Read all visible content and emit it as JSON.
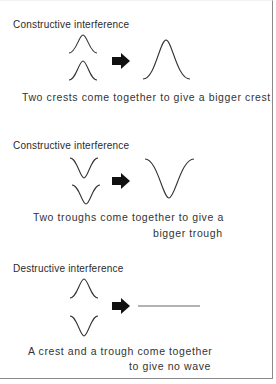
{
  "sections": [
    {
      "title": "Constructive interference",
      "caption_lines": [
        "Two crests come together to give a bigger crest"
      ],
      "inputs": [
        "crest",
        "crest"
      ],
      "result": "bigger crest"
    },
    {
      "title": "Constructive interference",
      "caption_lines": [
        "Two troughs come together to give a",
        "bigger trough"
      ],
      "inputs": [
        "trough",
        "trough"
      ],
      "result": "bigger trough"
    },
    {
      "title": "Destructive interference",
      "caption_lines": [
        "A crest and a trough come together",
        "to give no wave"
      ],
      "inputs": [
        "crest",
        "trough"
      ],
      "result": "no wave (flat line)"
    }
  ],
  "icons": {
    "arrow": "right-arrow-icon",
    "crest": "crest-wave-icon",
    "trough": "trough-wave-icon",
    "flat": "flat-line-icon"
  },
  "colors": {
    "ink": "#333333",
    "arrow": "#111111",
    "border": "#8a8a8a",
    "background": "#ffffff"
  }
}
